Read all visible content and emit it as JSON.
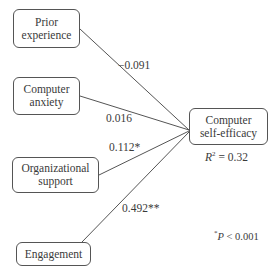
{
  "diagram": {
    "nodes": {
      "prior": {
        "line1": "Prior",
        "line2": "experience"
      },
      "anxiety": {
        "line1": "Computer",
        "line2": "anxiety"
      },
      "org": {
        "line1": "Organizational",
        "line2": "support"
      },
      "engagement": {
        "label": "Engagement"
      },
      "outcome": {
        "line1": "Computer",
        "line2": "self-efficacy"
      }
    },
    "paths": [
      {
        "from": "Prior experience",
        "to": "Computer self-efficacy",
        "coef": "−0.091"
      },
      {
        "from": "Computer anxiety",
        "to": "Computer self-efficacy",
        "coef": "0.016"
      },
      {
        "from": "Organizational support",
        "to": "Computer self-efficacy",
        "coef": "0.112*"
      },
      {
        "from": "Engagement",
        "to": "Computer self-efficacy",
        "coef": "0.492**"
      }
    ],
    "r2": {
      "symbol": "R",
      "exp": "2",
      "value": " = 0.32"
    },
    "footnote": {
      "star": "*",
      "p": "P",
      "text": " < 0.001"
    }
  }
}
